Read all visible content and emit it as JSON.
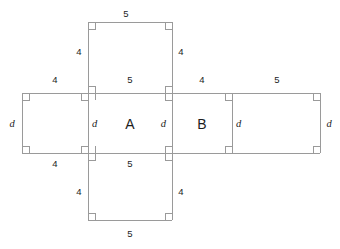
{
  "figure": {
    "kind": "net-of-rectangular-prism",
    "stroke_color": "#9a9a9a",
    "text_color": "#1d1d1d",
    "background_color": "#ffffff"
  },
  "faces": [
    {
      "id": "top-face",
      "label": "",
      "width_label": "5",
      "height_label": "4"
    },
    {
      "id": "left-face",
      "label": "",
      "width_label": "4",
      "height_label": "d"
    },
    {
      "id": "face-a",
      "label": "A",
      "width_label": "5",
      "height_label": "d"
    },
    {
      "id": "face-b",
      "label": "B",
      "width_label": "4",
      "height_label": "d"
    },
    {
      "id": "right-face",
      "label": "",
      "width_label": "5",
      "height_label": "d"
    },
    {
      "id": "bottom-face",
      "label": "",
      "width_label": "5",
      "height_label": "4"
    }
  ],
  "labels": {
    "top_rect_top": "5",
    "top_rect_left": "4",
    "top_rect_right": "4",
    "strip_top_1": "4",
    "strip_top_2": "5",
    "strip_top_3": "4",
    "strip_top_4": "5",
    "strip_left_d": "d",
    "strip_d_a_left": "d",
    "face_a": "A",
    "strip_d_a_right": "d",
    "face_b": "B",
    "strip_d_b_right": "d",
    "strip_right_d": "d",
    "strip_bottom_1": "4",
    "strip_bottom_2": "5",
    "bottom_rect_left": "4",
    "bottom_rect_right": "4",
    "bottom_rect_bottom": "5"
  }
}
